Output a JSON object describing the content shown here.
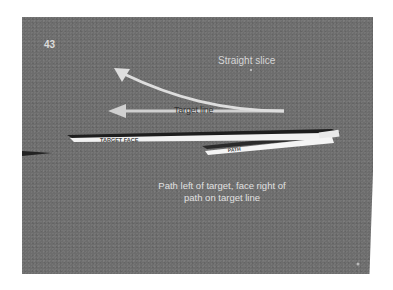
{
  "slide": {
    "number": "43",
    "title": "Straight slice",
    "arrow_label": "Target line",
    "caption_line1": "Path left of target, face right of",
    "caption_line2": "path on target line",
    "stick_labels": {
      "target_face": "TARGET   FACE",
      "path": "PATH"
    }
  },
  "colors": {
    "slide_background": "#6d6d6d",
    "page_background": "#ffffff",
    "arrow": "#d4d4d4",
    "stick": "#f2f2f2",
    "shadow": "#1e1e1e",
    "caption_text": "#e0e0e0",
    "label_text": "#333333"
  }
}
